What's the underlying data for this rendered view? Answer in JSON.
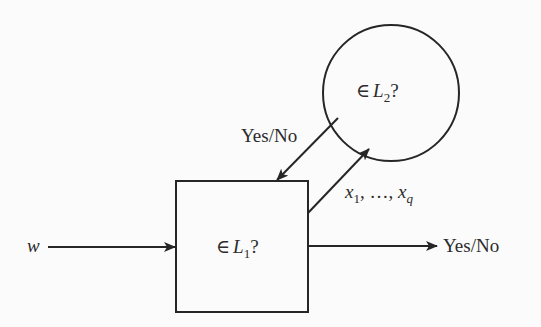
{
  "diagram": {
    "type": "oracle-reduction",
    "nodes": {
      "oracle": {
        "shape": "circle",
        "label_prefix": "∈",
        "label_var": "L",
        "label_sub": "2",
        "label_suffix": "?"
      },
      "machine": {
        "shape": "square",
        "label_prefix": "∈",
        "label_var": "L",
        "label_sub": "1",
        "label_suffix": "?"
      }
    },
    "edges": {
      "input": {
        "label": "w",
        "from": "left",
        "to": "machine"
      },
      "query": {
        "from": "machine",
        "to": "oracle",
        "label_parts": [
          "x",
          "1",
          ", …, ",
          "x",
          "q"
        ]
      },
      "oracle_answer": {
        "from": "oracle",
        "to": "machine",
        "label": "Yes/No"
      },
      "output": {
        "from": "machine",
        "to": "right",
        "label": "Yes/No"
      }
    },
    "colors": {
      "stroke": "#262626",
      "text": "#2b2b2b",
      "background": "#fbfbfb"
    }
  }
}
